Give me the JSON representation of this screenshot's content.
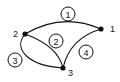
{
  "diagram": {
    "type": "graph",
    "nodes": [
      {
        "id": "1",
        "label": "1",
        "x": 101,
        "y": 29,
        "label_x": 110,
        "label_y": 32
      },
      {
        "id": "2",
        "label": "2",
        "x": 25,
        "y": 34,
        "label_x": 13,
        "label_y": 37
      },
      {
        "id": "3",
        "label": "3",
        "x": 63,
        "y": 68,
        "label_x": 68,
        "label_y": 76
      }
    ],
    "edges": [
      {
        "id": "e1",
        "label": "1",
        "from": "2",
        "to": "1",
        "path": "M25,34 Q62,12 101,29",
        "label_x": 68,
        "label_y": 14
      },
      {
        "id": "e2",
        "label": "2",
        "from": "2",
        "to": "3",
        "path": "M25,34 Q58,46 63,68",
        "label_x": 56,
        "label_y": 41
      },
      {
        "id": "e3",
        "label": "3",
        "from": "2",
        "to": "3",
        "path": "M25,34 C12,50 30,66 63,68",
        "label_x": 15,
        "label_y": 60
      },
      {
        "id": "e4",
        "label": "4",
        "from": "1",
        "to": "3",
        "path": "M101,29 Q70,38 63,68",
        "label_x": 86,
        "label_y": 52
      }
    ],
    "colors": {
      "stroke": "#111111",
      "background": "#ffffff"
    }
  }
}
